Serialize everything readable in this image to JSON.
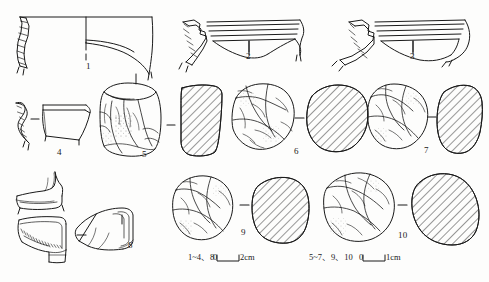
{
  "figure": {
    "kind": "archaeological-artefact-plate",
    "background_color": "#fdfdfc",
    "ink_color": "#1a1a1a",
    "width": 489,
    "height": 282
  },
  "items": [
    {
      "id": "1",
      "label": "1",
      "label_x": 86,
      "label_y": 62,
      "type": "pottery-rim-profile",
      "row": "top"
    },
    {
      "id": "2",
      "label": "2",
      "label_x": 249,
      "label_y": 55,
      "type": "pottery-rim-profile",
      "row": "top"
    },
    {
      "id": "3",
      "label": "3",
      "label_x": 413,
      "label_y": 55,
      "type": "pottery-rim-profile",
      "row": "top"
    },
    {
      "id": "4",
      "label": "4",
      "label_x": 40,
      "label_y": 148,
      "type": "pottery-rim-profile",
      "row": "middle"
    },
    {
      "id": "5",
      "label": "5",
      "label_x": 140,
      "label_y": 152,
      "type": "stone-core",
      "row": "middle"
    },
    {
      "id": "6",
      "label": "6",
      "label_x": 295,
      "label_y": 146,
      "type": "stone-core",
      "row": "middle"
    },
    {
      "id": "7",
      "label": "7",
      "label_x": 425,
      "label_y": 146,
      "type": "stone-core",
      "row": "middle"
    },
    {
      "id": "8",
      "label": "8",
      "label_x": 122,
      "label_y": 242,
      "type": "pottery-base-profile",
      "row": "bottom"
    },
    {
      "id": "9",
      "label": "9",
      "label_x": 242,
      "label_y": 228,
      "type": "stone-core",
      "row": "bottom"
    },
    {
      "id": "10",
      "label": "10",
      "label_x": 401,
      "label_y": 232,
      "type": "stone-core",
      "row": "bottom"
    }
  ],
  "scales": [
    {
      "name": "scale-bar-pottery",
      "items_text": "1~4、8",
      "zero_label": "0",
      "end_label": "2cm",
      "bar_x": 217,
      "bar_y": 258,
      "bar_width": 22,
      "text_x": 188,
      "text_y": 254
    },
    {
      "name": "scale-bar-stone",
      "items_text": "5~7、9、10",
      "zero_label": "0",
      "end_label": "1cm",
      "bar_x": 363,
      "bar_y": 258,
      "bar_width": 22,
      "text_x": 309,
      "text_y": 254
    }
  ],
  "tick_marks": [
    {
      "name": "tick-item-1-a",
      "x": 86,
      "y1": 42,
      "y2": 50
    },
    {
      "name": "tick-item-1-b",
      "x": 86,
      "y1": 54,
      "y2": 60
    },
    {
      "name": "tick-item-2",
      "x": 249,
      "y1": 41,
      "y2": 52
    },
    {
      "name": "tick-item-3",
      "x": 413,
      "y1": 41,
      "y2": 52
    },
    {
      "name": "tick-item-5-top",
      "x": 136,
      "y1": 74,
      "y2": 84
    },
    {
      "name": "tick-item-8",
      "x": 122,
      "y1": 215,
      "y2": 224
    }
  ],
  "connectors": [
    {
      "name": "connector-item-4",
      "x1": 31,
      "x2": 39,
      "y": 119
    },
    {
      "name": "connector-item-5",
      "x1": 167,
      "x2": 175,
      "y": 125
    },
    {
      "name": "connector-item-6",
      "x1": 295,
      "x2": 304,
      "y": 118
    },
    {
      "name": "connector-item-7",
      "x1": 428,
      "x2": 436,
      "y": 117
    },
    {
      "name": "connector-item-8",
      "x1": 77,
      "x2": 86,
      "y": 235
    },
    {
      "name": "connector-item-9",
      "x1": 240,
      "x2": 249,
      "y": 205
    },
    {
      "name": "connector-item-10",
      "x1": 398,
      "x2": 407,
      "y": 205
    }
  ]
}
